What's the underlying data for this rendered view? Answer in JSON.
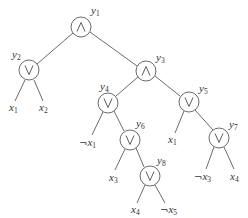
{
  "diagram": {
    "type": "boolean-formula-tree",
    "nodes": [
      {
        "id": "y1",
        "name": "y",
        "sub": "1",
        "op": "and",
        "cx": 81,
        "cy": 27
      },
      {
        "id": "y2",
        "name": "y",
        "sub": "2",
        "op": "or",
        "cx": 29,
        "cy": 70
      },
      {
        "id": "y3",
        "name": "y",
        "sub": "3",
        "op": "and",
        "cx": 146,
        "cy": 71
      },
      {
        "id": "y4",
        "name": "y",
        "sub": "4",
        "op": "or",
        "cx": 108,
        "cy": 103
      },
      {
        "id": "y5",
        "name": "y",
        "sub": "5",
        "op": "or",
        "cx": 189,
        "cy": 102
      },
      {
        "id": "y6",
        "name": "y",
        "sub": "6",
        "op": "or",
        "cx": 130,
        "cy": 140
      },
      {
        "id": "y7",
        "name": "y",
        "sub": "7",
        "op": "or",
        "cx": 219,
        "cy": 138
      },
      {
        "id": "y8",
        "name": "y",
        "sub": "8",
        "op": "or",
        "cx": 150,
        "cy": 176
      }
    ],
    "leaves": [
      {
        "id": "l1",
        "neg": "",
        "name": "x",
        "sub": "1",
        "parent": "y2"
      },
      {
        "id": "l2",
        "neg": "",
        "name": "x",
        "sub": "2",
        "parent": "y2"
      },
      {
        "id": "l3",
        "neg": "¬",
        "name": "x",
        "sub": "1",
        "parent": "y4"
      },
      {
        "id": "l4",
        "neg": "",
        "name": "x",
        "sub": "3",
        "parent": "y6"
      },
      {
        "id": "l5",
        "neg": "",
        "name": "x",
        "sub": "1",
        "parent": "y5"
      },
      {
        "id": "l6",
        "neg": "¬",
        "name": "x",
        "sub": "3",
        "parent": "y7"
      },
      {
        "id": "l7",
        "neg": "",
        "name": "x",
        "sub": "4",
        "parent": "y7"
      },
      {
        "id": "l8",
        "neg": "",
        "name": "x",
        "sub": "4",
        "parent": "y8"
      },
      {
        "id": "l9",
        "neg": "¬",
        "name": "x",
        "sub": "5",
        "parent": "y8"
      }
    ],
    "edges": [
      [
        "y1",
        "y2"
      ],
      [
        "y1",
        "y3"
      ],
      [
        "y2",
        "x1"
      ],
      [
        "y2",
        "x2"
      ],
      [
        "y3",
        "y4"
      ],
      [
        "y3",
        "y5"
      ],
      [
        "y4",
        "¬x1"
      ],
      [
        "y4",
        "y6"
      ],
      [
        "y6",
        "x3"
      ],
      [
        "y6",
        "y8"
      ],
      [
        "y8",
        "x4"
      ],
      [
        "y8",
        "¬x5"
      ],
      [
        "y5",
        "x1"
      ],
      [
        "y5",
        "y7"
      ],
      [
        "y7",
        "¬x3"
      ],
      [
        "y7",
        "x4"
      ]
    ],
    "symbols": {
      "and": "∧",
      "or": "∨"
    },
    "colors": {
      "stroke": "#5a5a5a",
      "text": "#333333",
      "background": "#ffffff"
    }
  }
}
